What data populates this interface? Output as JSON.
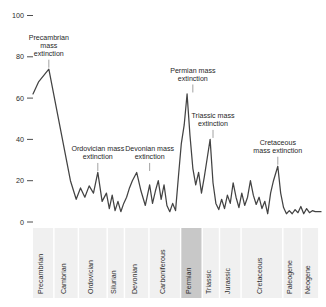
{
  "chart_data": {
    "type": "line",
    "title": "",
    "subtitle": "",
    "xlabel": "",
    "ylabel": "",
    "xlim": [
      0,
      100
    ],
    "ylim": [
      0,
      100
    ],
    "grid": false,
    "legend_position": "none",
    "line_color": "#434343",
    "band_color": "#f0f0f0",
    "band_highlight_color": "#c8c8c8",
    "y_ticks": [
      0,
      20,
      40,
      60,
      80,
      100
    ],
    "y_tick_labels": [
      "0",
      "20",
      "40",
      "60",
      "80",
      "100"
    ],
    "annotations": [
      {
        "label": "Precambrian mass extinction",
        "lines": [
          "Precambrian",
          "mass",
          "extinction"
        ],
        "target_x": 5.5,
        "target_y": 74
      },
      {
        "label": "Ordovician mass extinction",
        "lines": [
          "Ordovician mass",
          "extinction"
        ],
        "target_x": 22.5,
        "target_y": 24
      },
      {
        "label": "Devonian mass extinction",
        "lines": [
          "Devonian mass",
          "extinction"
        ],
        "target_x": 40.5,
        "target_y": 24
      },
      {
        "label": "Permian mass extinction",
        "lines": [
          "Permian mass",
          "extinction"
        ],
        "target_x": 55.5,
        "target_y": 62
      },
      {
        "label": "Triassic mass extinction",
        "lines": [
          "Triassic mass",
          "extinction"
        ],
        "target_x": 62.5,
        "target_y": 40
      },
      {
        "label": "Cretaceous mass extinction",
        "lines": [
          "Cretaceous",
          "mass extinction"
        ],
        "target_x": 85.0,
        "target_y": 27
      }
    ],
    "periods": [
      {
        "name": "Precambrian",
        "start": 0.0,
        "end": 7.0,
        "highlight": false
      },
      {
        "name": "Cambrian",
        "start": 7.5,
        "end": 15.5,
        "highlight": false
      },
      {
        "name": "Ordovician",
        "start": 16.0,
        "end": 25.5,
        "highlight": false
      },
      {
        "name": "Silurian",
        "start": 26.0,
        "end": 31.5,
        "highlight": false
      },
      {
        "name": "Devonian",
        "start": 32.0,
        "end": 40.0,
        "highlight": false
      },
      {
        "name": "Carboniferous",
        "start": 40.5,
        "end": 51.0,
        "highlight": false
      },
      {
        "name": "Permian",
        "start": 51.5,
        "end": 58.5,
        "highlight": true
      },
      {
        "name": "Triassic",
        "start": 59.0,
        "end": 64.5,
        "highlight": false
      },
      {
        "name": "Jurassic",
        "start": 65.0,
        "end": 72.0,
        "highlight": false
      },
      {
        "name": "Cretaceous",
        "start": 72.5,
        "end": 86.5,
        "highlight": false
      },
      {
        "name": "Paleogene",
        "start": 87.0,
        "end": 93.0,
        "highlight": false
      },
      {
        "name": "Neogene",
        "start": 93.5,
        "end": 99.0,
        "highlight": false
      }
    ],
    "x": [
      0.0,
      2.0,
      5.5,
      13.0,
      15.0,
      16.5,
      18.0,
      19.5,
      21.0,
      22.5,
      24.0,
      25.5,
      26.5,
      27.5,
      28.5,
      29.5,
      30.5,
      31.5,
      32.5,
      33.5,
      34.5,
      36.0,
      37.5,
      39.0,
      40.5,
      41.5,
      42.5,
      43.5,
      44.5,
      45.5,
      46.5,
      47.5,
      48.5,
      49.5,
      50.5,
      51.5,
      52.5,
      53.5,
      54.5,
      55.5,
      56.5,
      57.5,
      58.5,
      59.5,
      60.5,
      61.5,
      62.5,
      63.5,
      64.5,
      65.5,
      66.5,
      67.5,
      68.5,
      69.5,
      70.5,
      71.5,
      72.5,
      73.5,
      74.5,
      75.5,
      76.5,
      77.5,
      78.5,
      79.5,
      80.5,
      81.5,
      82.5,
      83.5,
      85.0,
      86.0,
      87.0,
      88.0,
      89.0,
      90.0,
      91.0,
      92.0,
      93.0,
      94.0,
      95.0,
      96.0,
      97.0,
      98.0,
      99.0,
      100.0
    ],
    "y": [
      62.0,
      68.0,
      74.0,
      20.0,
      11.0,
      16.5,
      12.0,
      17.5,
      14.0,
      24.0,
      10.0,
      14.0,
      6.5,
      13.0,
      5.5,
      10.0,
      5.0,
      9.0,
      12.0,
      16.5,
      20.0,
      24.0,
      15.0,
      8.0,
      18.0,
      9.0,
      15.0,
      20.0,
      11.0,
      18.0,
      8.0,
      5.0,
      9.0,
      5.5,
      22.0,
      38.0,
      47.0,
      62.0,
      42.0,
      26.0,
      18.0,
      24.0,
      14.0,
      22.0,
      31.0,
      40.0,
      19.0,
      9.0,
      6.0,
      11.0,
      6.5,
      13.0,
      9.0,
      19.0,
      12.0,
      7.0,
      14.0,
      8.0,
      12.0,
      20.0,
      13.0,
      8.5,
      12.0,
      6.5,
      10.0,
      4.0,
      14.0,
      20.0,
      27.0,
      14.0,
      7.0,
      4.0,
      5.5,
      4.0,
      6.0,
      4.5,
      7.5,
      4.0,
      6.5,
      4.5,
      5.5,
      5.0,
      5.0,
      5.0
    ]
  }
}
